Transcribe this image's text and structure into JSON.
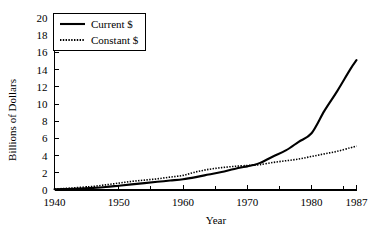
{
  "chart_data": {
    "type": "line",
    "title": "",
    "xlabel": "Year",
    "ylabel": "Billions of Dollars",
    "xlim": [
      1940,
      1987
    ],
    "ylim": [
      0,
      20
    ],
    "grid": false,
    "legend_position": "top-left",
    "x_ticks": [
      1940,
      1950,
      1960,
      1970,
      1980,
      1987
    ],
    "x_tick_labels": [
      "1940",
      "1950",
      "1960",
      "1970",
      "1980",
      "1987"
    ],
    "x_minor_ticks": [
      1945,
      1955,
      1965,
      1975,
      1985
    ],
    "y_ticks": [
      0,
      2,
      4,
      6,
      8,
      10,
      12,
      14,
      16,
      18,
      20
    ],
    "y_tick_labels": [
      "0",
      "2",
      "4",
      "6",
      "8",
      "10",
      "12",
      "14",
      "16",
      "18",
      "20"
    ],
    "x": [
      1940,
      1942,
      1944,
      1946,
      1948,
      1950,
      1952,
      1954,
      1956,
      1958,
      1960,
      1962,
      1964,
      1966,
      1968,
      1970,
      1971,
      1972,
      1974,
      1976,
      1978,
      1980,
      1982,
      1984,
      1986,
      1987
    ],
    "series": [
      {
        "name": "Current $",
        "style": "solid",
        "values": [
          0.08,
          0.12,
          0.18,
          0.25,
          0.35,
          0.5,
          0.65,
          0.8,
          0.95,
          1.1,
          1.25,
          1.5,
          1.8,
          2.1,
          2.45,
          2.75,
          2.9,
          3.15,
          3.9,
          4.6,
          5.6,
          6.6,
          9.2,
          11.5,
          14.0,
          15.1
        ]
      },
      {
        "name": "Constant $",
        "style": "dotted",
        "values": [
          0.12,
          0.2,
          0.3,
          0.42,
          0.6,
          0.8,
          1.0,
          1.15,
          1.3,
          1.5,
          1.7,
          2.1,
          2.4,
          2.6,
          2.75,
          2.85,
          2.9,
          2.95,
          3.2,
          3.4,
          3.6,
          3.9,
          4.2,
          4.5,
          4.9,
          5.1
        ]
      }
    ]
  },
  "legend": {
    "items": [
      {
        "label": "Current $",
        "style": "solid"
      },
      {
        "label": "Constant $",
        "style": "dotted"
      }
    ]
  }
}
